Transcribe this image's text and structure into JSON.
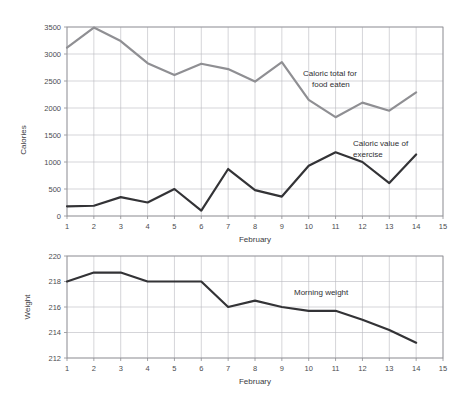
{
  "page": {
    "clipped_header_text": "",
    "background_color": "#ffffff"
  },
  "colors": {
    "food_line": "#8f8f93",
    "exercise_line": "#333336",
    "weight_line": "#333336",
    "grid": "#b9b9bf",
    "axis": "#8d8d92",
    "text": "#3a3a3e"
  },
  "charts": {
    "top": {
      "ylabel": "Calories",
      "xlabel": "February",
      "annotation_food_line1": "Caloric total for",
      "annotation_food_line2": "food eaten",
      "annotation_exercise_line1": "Caloric value of",
      "annotation_exercise_line2": "exercise",
      "yticks": [
        "0",
        "500",
        "1000",
        "1500",
        "2000",
        "2500",
        "3000",
        "3500"
      ],
      "xticks": [
        "1",
        "2",
        "3",
        "4",
        "5",
        "6",
        "7",
        "8",
        "9",
        "10",
        "11",
        "12",
        "13",
        "14",
        "15"
      ]
    },
    "bottom": {
      "ylabel": "Weight",
      "xlabel": "February",
      "annotation_weight": "Morning weight",
      "yticks": [
        "212",
        "214",
        "216",
        "218",
        "220"
      ],
      "xticks": [
        "1",
        "2",
        "3",
        "4",
        "5",
        "6",
        "7",
        "8",
        "9",
        "10",
        "11",
        "12",
        "13",
        "14",
        "15"
      ]
    }
  },
  "chart_data": [
    {
      "type": "line",
      "title": "",
      "xlabel": "February",
      "ylabel": "Calories",
      "xlim": [
        1,
        15
      ],
      "ylim": [
        0,
        3500
      ],
      "ytick_step": 500,
      "grid": true,
      "legend": "annotations",
      "x": [
        1,
        2,
        3,
        4,
        5,
        6,
        7,
        8,
        9,
        10,
        11,
        12,
        13,
        14
      ],
      "series": [
        {
          "name": "Caloric total for food eaten",
          "color": "#8f8f93",
          "values": [
            3120,
            3490,
            3240,
            2830,
            2610,
            2820,
            2720,
            2490,
            2850,
            2150,
            1830,
            2100,
            1950,
            2290
          ]
        },
        {
          "name": "Caloric value of exercise",
          "color": "#333336",
          "values": [
            180,
            190,
            350,
            250,
            500,
            100,
            870,
            480,
            360,
            930,
            1180,
            1000,
            610,
            1140
          ]
        }
      ]
    },
    {
      "type": "line",
      "title": "",
      "xlabel": "February",
      "ylabel": "Weight",
      "xlim": [
        1,
        15
      ],
      "ylim": [
        212,
        220
      ],
      "ytick_step": 2,
      "grid": true,
      "legend": "annotations",
      "x": [
        1,
        2,
        3,
        4,
        5,
        6,
        7,
        8,
        9,
        10,
        11,
        12,
        13,
        14
      ],
      "series": [
        {
          "name": "Morning weight",
          "color": "#333336",
          "values": [
            218.0,
            218.7,
            218.7,
            218.0,
            218.0,
            218.0,
            216.0,
            216.5,
            216.0,
            215.7,
            215.7,
            215.0,
            214.2,
            213.2
          ]
        }
      ]
    }
  ]
}
